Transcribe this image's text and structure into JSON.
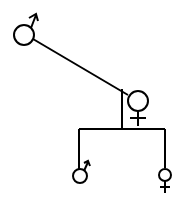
{
  "diagram": {
    "type": "family-tree",
    "stroke_color": "#000000",
    "background": "#ffffff",
    "nodes": [
      {
        "id": "father",
        "sex": "male",
        "symbol": "♂"
      },
      {
        "id": "mother",
        "sex": "female",
        "symbol": "♀"
      },
      {
        "id": "son",
        "sex": "male",
        "symbol": "♂"
      },
      {
        "id": "daughter",
        "sex": "female",
        "symbol": "♀"
      }
    ],
    "edges": [
      {
        "from": "father",
        "to": "mother",
        "kind": "marriage"
      },
      {
        "from": "marriage",
        "to": "son",
        "kind": "descent"
      },
      {
        "from": "marriage",
        "to": "daughter",
        "kind": "descent"
      }
    ]
  }
}
